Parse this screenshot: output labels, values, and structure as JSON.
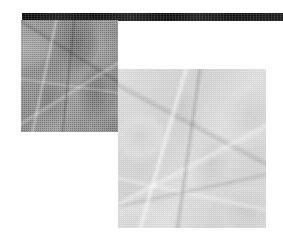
{
  "figure": {
    "width": 283,
    "height": 241,
    "background_color": "#ffffff",
    "caption": ""
  },
  "top_bar": {
    "name": "top-rule",
    "color": "#121212",
    "x": 22,
    "y": 13,
    "width": 261,
    "height": 8,
    "label": ""
  },
  "panels": [
    {
      "id": "panel-left",
      "label": "",
      "render_style": "halftone-dither",
      "tone": "dark",
      "base_color": "#8a8a8a",
      "x": 21,
      "y": 20,
      "width": 97,
      "height": 112,
      "subject": "organic-lobed-texture"
    },
    {
      "id": "panel-right",
      "label": "",
      "render_style": "halftone-dither",
      "tone": "light",
      "base_color": "#d6d6d6",
      "x": 118,
      "y": 69,
      "width": 148,
      "height": 159,
      "subject": "organic-lobed-texture"
    }
  ]
}
